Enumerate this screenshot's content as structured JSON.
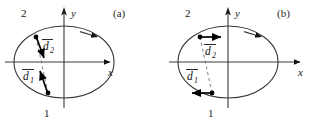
{
  "figure": {
    "background": "#ffffff",
    "stroke_color": "#3a3a3a",
    "vector_color": "#000000",
    "panels": [
      {
        "id": "a",
        "panel_label": "(a)",
        "axes": {
          "x_label": "x",
          "y_label": "y"
        },
        "orbit": {
          "shape": "ellipse",
          "direction_marker": "arrowhead-on-upper-right"
        },
        "points": [
          {
            "label": "1",
            "position": "lower-left-on-ellipse"
          },
          {
            "label": "2",
            "position": "upper-left-on-ellipse"
          }
        ],
        "chord": {
          "style": "dashed",
          "from": "1",
          "to": "2"
        },
        "vectors": [
          {
            "name": "d1",
            "label": "d",
            "subscript": "1",
            "overbar": true,
            "orientation": "oblique-up-left",
            "from_point": "1"
          },
          {
            "name": "d2",
            "label": "d",
            "subscript": "2",
            "overbar": true,
            "orientation": "oblique-down-left",
            "from_point": "2"
          }
        ]
      },
      {
        "id": "b",
        "panel_label": "(b)",
        "axes": {
          "x_label": "x",
          "y_label": "y"
        },
        "orbit": {
          "shape": "ellipse",
          "direction_marker": "arrowhead-on-upper-right"
        },
        "points": [
          {
            "label": "1",
            "position": "lower-left-on-ellipse"
          },
          {
            "label": "2",
            "position": "upper-left-on-ellipse"
          }
        ],
        "chord": {
          "style": "dashed",
          "from": "1",
          "to": "2"
        },
        "vectors": [
          {
            "name": "d1",
            "label": "d",
            "subscript": "1",
            "overbar": true,
            "orientation": "horizontal-left",
            "from_point": "1"
          },
          {
            "name": "d2",
            "label": "d",
            "subscript": "2",
            "overbar": true,
            "orientation": "horizontal-right",
            "from_point": "2"
          }
        ]
      }
    ]
  }
}
